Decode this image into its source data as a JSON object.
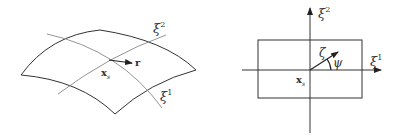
{
  "left_panel": {
    "description": "curved surface patch with coordinate curves",
    "labels": {
      "xi2": "ξ",
      "xi2_sup": "2",
      "xi1": "ξ",
      "xi1_sup": "1",
      "point": "x",
      "point_sub": "s",
      "vector": "r"
    }
  },
  "right_panel": {
    "description": "parametric rectangle with coordinate axes",
    "labels": {
      "xi2": "ξ",
      "xi2_sup": "2",
      "xi1": "ξ",
      "xi1_sup": "1",
      "point": "x",
      "point_sub": "s",
      "vector": "ζ",
      "angle": "ψ"
    }
  },
  "colors": {
    "stroke": "#333333",
    "curve": "#888888"
  }
}
